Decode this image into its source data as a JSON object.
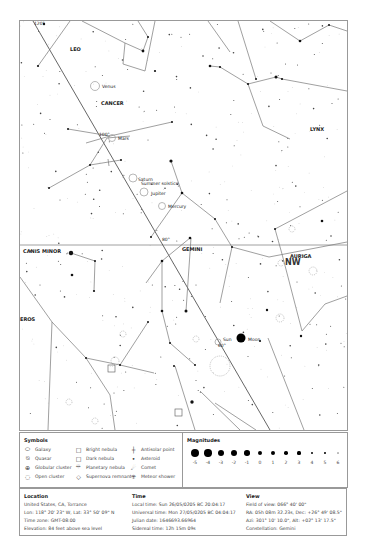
{
  "map": {
    "constellations": [
      {
        "name": "LEO"
      },
      {
        "name": "CANCER"
      },
      {
        "name": "LYNX"
      },
      {
        "name": "GEMINI"
      },
      {
        "name": "CANIS MINOR"
      },
      {
        "name": "AURIGA"
      },
      {
        "name": "EROS"
      }
    ],
    "direction_label": "NW",
    "planets": [
      {
        "name": "Venus"
      },
      {
        "name": "Mars"
      },
      {
        "name": "Saturn"
      },
      {
        "name": "Jupiter"
      },
      {
        "name": "Mercury"
      },
      {
        "name": "Sun"
      },
      {
        "name": "Moon"
      }
    ],
    "annotations": {
      "solstice": "Summer solstice",
      "ecliptic_ticks": [
        "120°",
        "100°",
        "80°",
        "60°"
      ]
    }
  },
  "symbols": {
    "title": "Symbols",
    "items": [
      {
        "icon": "galaxy-icon",
        "label": "Galaxy"
      },
      {
        "icon": "quasar-icon",
        "label": "Quasar"
      },
      {
        "icon": "globular-cluster-icon",
        "label": "Globular cluster"
      },
      {
        "icon": "open-cluster-icon",
        "label": "Open cluster"
      },
      {
        "icon": "bright-nebula-icon",
        "label": "Bright nebula"
      },
      {
        "icon": "dark-nebula-icon",
        "label": "Dark nebula"
      },
      {
        "icon": "planetary-nebula-icon",
        "label": "Planetary nebula"
      },
      {
        "icon": "supernova-remnant-icon",
        "label": "Supernova remnant"
      },
      {
        "icon": "antisolar-point-icon",
        "label": "Antisolar point"
      },
      {
        "icon": "asteroid-icon",
        "label": "Asteroid"
      },
      {
        "icon": "comet-icon",
        "label": "Comet"
      },
      {
        "icon": "meteor-shower-icon",
        "label": "Meteor shower"
      }
    ]
  },
  "magnitudes": {
    "title": "Magnitudes",
    "values": [
      "-5",
      "-4",
      "-3",
      "-2",
      "-1",
      "0",
      "1",
      "2",
      "3",
      "4",
      "5",
      "6"
    ]
  },
  "location": {
    "title": "Location",
    "lines": [
      "United States, CA, Torrance",
      "Lon: 118° 20' 23\" W, Lat: 33° 50' 09\" N",
      "Time zone: GMT-08:00",
      "Elevation: 84 feet above sea level"
    ]
  },
  "time": {
    "title": "Time",
    "lines": [
      "Local time: Sun 26/05/0205 BC 20:04:17",
      "Universal time: Mon 27/05/0205 BC 04:04:17",
      "Julian date: 1646693.66964",
      "Sidereal time: 12h 15m 09s"
    ]
  },
  "view": {
    "title": "View",
    "lines": [
      "Field of view: 066° 40' 00\"",
      "RA: 05h 08m 32.23s, Dec: +26° 49' 08.5\"",
      "Azi: 301° 10' 10.0\", Alt: +02° 13' 17.5\"",
      "Constellation: Gemini"
    ]
  }
}
